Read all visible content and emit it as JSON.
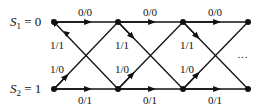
{
  "diagram": {
    "type": "trellis",
    "states": [
      {
        "label_sym": "S",
        "label_sub": "1",
        "label_val": " = 0",
        "y": 22
      },
      {
        "label_sym": "S",
        "label_sub": "2",
        "label_val": " = 1",
        "y": 89
      }
    ],
    "node_x": [
      54,
      118,
      183,
      248
    ],
    "edges": {
      "top_straight": "0/0",
      "bottom_straight": "0/1",
      "top_to_bottom": "1/1",
      "bottom_to_top": "1/0"
    },
    "labels": {
      "top": [
        "0/0",
        "0/0",
        "0/0"
      ],
      "bottom": [
        "0/1",
        "0/1",
        "0/1"
      ],
      "cross_down": [
        "1/1",
        "1/1",
        "1/1"
      ],
      "cross_up": [
        "1/0",
        "1/0",
        "1/0"
      ]
    },
    "continuation": "…",
    "colors": {
      "line": "#111111",
      "background": "#ffffff"
    }
  }
}
